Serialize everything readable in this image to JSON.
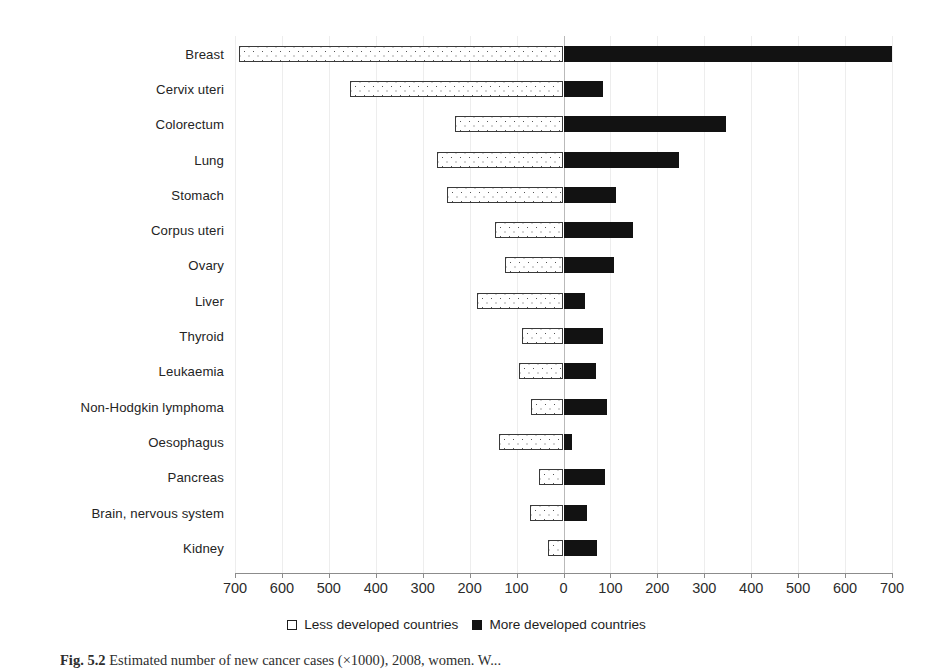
{
  "chart_data": {
    "type": "bar",
    "orientation": "horizontal-diverging",
    "title": "",
    "xlabel": "",
    "ylabel": "",
    "xlim": [
      -700,
      700
    ],
    "xticks": [
      -700,
      -600,
      -500,
      -400,
      -300,
      -200,
      -100,
      0,
      100,
      200,
      300,
      400,
      500,
      600,
      700
    ],
    "xtick_labels": [
      "700",
      "600",
      "500",
      "400",
      "300",
      "200",
      "100",
      "0",
      "100",
      "200",
      "300",
      "400",
      "500",
      "600",
      "700"
    ],
    "grid": true,
    "legend_position": "bottom-center",
    "categories": [
      "Breast",
      "Cervix uteri",
      "Colorectum",
      "Lung",
      "Stomach",
      "Corpus uteri",
      "Ovary",
      "Liver",
      "Thyroid",
      "Leukaemia",
      "Non-Hodgkin lymphoma",
      "Oesophagus",
      "Pancreas",
      "Brain, nervous system",
      "Kidney"
    ],
    "series": [
      {
        "name": "Less developed countries",
        "direction": "left",
        "color": "#ffffff",
        "edge_color": "#3a3a3a",
        "pattern": "dotted",
        "values": [
          691,
          455,
          232,
          270,
          249,
          145,
          125,
          185,
          89,
          94,
          70,
          138,
          53,
          72,
          34
        ]
      },
      {
        "name": "More developed countries",
        "direction": "right",
        "color": "#121212",
        "edge_color": "#121212",
        "pattern": "solid",
        "values": [
          700,
          85,
          347,
          247,
          111,
          149,
          107,
          45,
          85,
          70,
          92,
          19,
          89,
          51,
          72
        ]
      }
    ]
  },
  "legend": {
    "items": [
      {
        "label": "Less developed countries",
        "swatch": "open-square-icon"
      },
      {
        "label": "More developed countries",
        "swatch": "filled-square-icon"
      }
    ]
  },
  "caption": {
    "figure_number": "Fig. 5.2",
    "text": "Estimated number of new cancer cases (×1000), 2008, women. W..."
  }
}
